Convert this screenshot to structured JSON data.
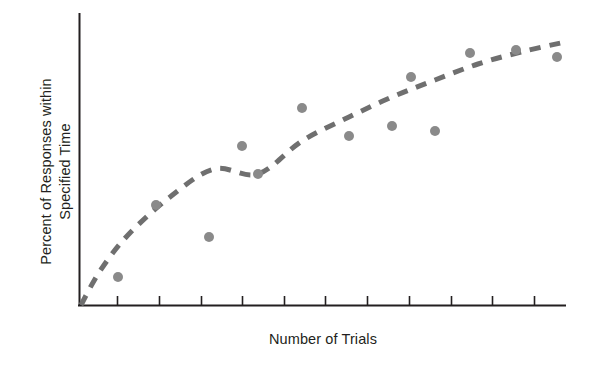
{
  "figure": {
    "background_color": "#ffffff",
    "axis_color": "#231f20",
    "marker_color": "#8a8a8a",
    "trend_color": "#6f6f6f"
  },
  "labels": {
    "y_axis_title": "Percent of Responses within\nSpecified Time",
    "x_axis_title": "Number of Trials"
  },
  "chart_data": {
    "type": "scatter",
    "title": "",
    "subtitle": "",
    "xlabel": "Number of Trials",
    "ylabel": "Percent of Responses within Specified Time",
    "xlim": [
      0,
      12
    ],
    "ylim": [
      0,
      100
    ],
    "grid": false,
    "legend": null,
    "x_tick_labels": [],
    "y_tick_labels": [],
    "x_tick_count": 11,
    "y_tick_count": 0,
    "annotations": [],
    "series": [
      {
        "name": "Observed responses",
        "type": "scatter",
        "marker": "circle",
        "color": "#8a8a8a",
        "marker_radius_px": 5,
        "points": [
          {
            "x": 0.9,
            "y": 9.0,
            "px": 118,
            "py": 277
          },
          {
            "x": 1.9,
            "y": 34.0,
            "px": 156,
            "py": 205
          },
          {
            "x": 3.2,
            "y": 23.0,
            "px": 209,
            "py": 237
          },
          {
            "x": 4.0,
            "y": 54.0,
            "px": 242,
            "py": 146
          },
          {
            "x": 4.4,
            "y": 45.0,
            "px": 258,
            "py": 174
          },
          {
            "x": 5.5,
            "y": 68.0,
            "px": 302,
            "py": 108
          },
          {
            "x": 6.6,
            "y": 59.0,
            "px": 349,
            "py": 136
          },
          {
            "x": 7.7,
            "y": 62.0,
            "px": 392,
            "py": 126
          },
          {
            "x": 8.2,
            "y": 79.0,
            "px": 411,
            "py": 77
          },
          {
            "x": 8.8,
            "y": 60.0,
            "px": 435,
            "py": 131
          },
          {
            "x": 9.7,
            "y": 87.0,
            "px": 470,
            "py": 53
          },
          {
            "x": 10.8,
            "y": 88.0,
            "px": 516,
            "py": 50
          },
          {
            "x": 11.7,
            "y": 85.0,
            "px": 557,
            "py": 57
          }
        ]
      },
      {
        "name": "Fitted learning curve",
        "type": "line",
        "style": "dashed",
        "color": "#6f6f6f",
        "line_width_px": 5,
        "dash_pattern_px": [
          11,
          9
        ],
        "points": [
          {
            "x": 0.0,
            "y": 0.0,
            "px": 81,
            "py": 305
          },
          {
            "x": 0.5,
            "y": 12.0,
            "px": 100,
            "py": 271
          },
          {
            "x": 1.2,
            "y": 25.0,
            "px": 128,
            "py": 235
          },
          {
            "x": 2.2,
            "y": 38.0,
            "px": 170,
            "py": 197
          },
          {
            "x": 3.3,
            "y": 48.0,
            "px": 214,
            "py": 169
          },
          {
            "x": 4.4,
            "y": 56.0,
            "px": 258,
            "py": 174
          },
          {
            "x": 5.5,
            "y": 64.0,
            "px": 302,
            "py": 141
          },
          {
            "x": 6.6,
            "y": 72.0,
            "px": 349,
            "py": 117
          },
          {
            "x": 7.7,
            "y": 78.0,
            "px": 392,
            "py": 97
          },
          {
            "x": 8.8,
            "y": 83.0,
            "px": 435,
            "py": 80
          },
          {
            "x": 9.9,
            "y": 87.0,
            "px": 478,
            "py": 64
          },
          {
            "x": 11.0,
            "y": 90.0,
            "px": 521,
            "py": 52
          },
          {
            "x": 12.0,
            "y": 92.0,
            "px": 565,
            "py": 42
          }
        ]
      }
    ],
    "axes_geometry": {
      "origin_px": [
        79,
        306
      ],
      "y_axis_top_px": 13,
      "x_axis_right_px": 566,
      "tick_length_px": 9,
      "tick_positions_px": [
        117,
        159,
        201,
        242,
        284,
        325,
        367,
        409,
        451,
        492,
        534
      ]
    }
  }
}
